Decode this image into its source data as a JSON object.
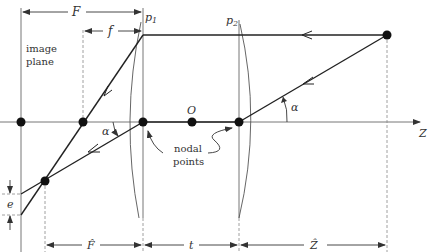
{
  "diagram": {
    "labels": {
      "F": "F",
      "f": "f",
      "p1": "p",
      "p1_sub": "1",
      "p2": "p",
      "p2_sub": "2",
      "image_plane_line1": "image",
      "image_plane_line2": "plane",
      "O": "O",
      "Z": "Z",
      "alpha_left": "α",
      "alpha_right": "α",
      "nodal_line1": "nodal",
      "nodal_line2": "points",
      "e": "e",
      "F_hat": "F̂",
      "t": "t",
      "Z_hat": "Ẑ"
    },
    "points": [
      {
        "name": "image-plane-axis-point",
        "x": 21,
        "y": 122
      },
      {
        "name": "focal-point",
        "x": 83,
        "y": 122
      },
      {
        "name": "nodal-point-1",
        "x": 143,
        "y": 122
      },
      {
        "name": "center-O",
        "x": 192,
        "y": 122
      },
      {
        "name": "nodal-point-2",
        "x": 239,
        "y": 122
      },
      {
        "name": "object-point",
        "x": 387,
        "y": 35
      },
      {
        "name": "image-point",
        "x": 45,
        "y": 181
      }
    ],
    "colors": {
      "line": "#333333",
      "thin": "#777777",
      "point": "#111111",
      "background": "#ffffff"
    }
  }
}
